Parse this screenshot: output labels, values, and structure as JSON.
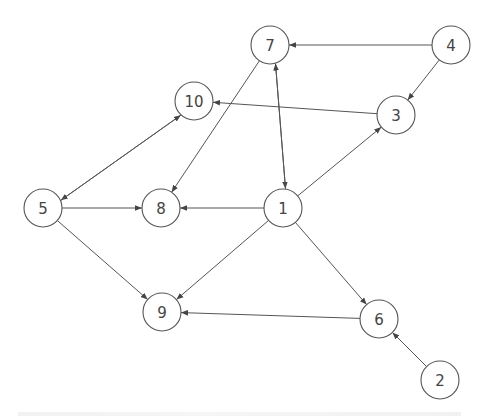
{
  "diagram": {
    "type": "directed-graph",
    "node_radius": 19,
    "stroke_color": "#555555",
    "nodes": [
      {
        "id": "1",
        "label": "1",
        "x": 283,
        "y": 208
      },
      {
        "id": "2",
        "label": "2",
        "x": 440,
        "y": 380
      },
      {
        "id": "3",
        "label": "3",
        "x": 396,
        "y": 115
      },
      {
        "id": "4",
        "label": "4",
        "x": 451,
        "y": 45
      },
      {
        "id": "5",
        "label": "5",
        "x": 43,
        "y": 208
      },
      {
        "id": "6",
        "label": "6",
        "x": 379,
        "y": 319
      },
      {
        "id": "7",
        "label": "7",
        "x": 270,
        "y": 45
      },
      {
        "id": "8",
        "label": "8",
        "x": 161,
        "y": 208
      },
      {
        "id": "9",
        "label": "9",
        "x": 162,
        "y": 312
      },
      {
        "id": "10",
        "label": "10",
        "x": 194,
        "y": 101
      }
    ],
    "edges": [
      {
        "from": "4",
        "to": "7"
      },
      {
        "from": "4",
        "to": "3"
      },
      {
        "from": "3",
        "to": "10"
      },
      {
        "from": "10",
        "to": "5",
        "offset": -4
      },
      {
        "from": "5",
        "to": "10",
        "offset": -4
      },
      {
        "from": "7",
        "to": "8"
      },
      {
        "from": "7",
        "to": "1",
        "offset": 4
      },
      {
        "from": "1",
        "to": "7",
        "offset": 4
      },
      {
        "from": "1",
        "to": "3"
      },
      {
        "from": "1",
        "to": "8"
      },
      {
        "from": "5",
        "to": "8"
      },
      {
        "from": "5",
        "to": "9"
      },
      {
        "from": "1",
        "to": "9"
      },
      {
        "from": "1",
        "to": "6"
      },
      {
        "from": "6",
        "to": "9"
      },
      {
        "from": "2",
        "to": "6"
      }
    ]
  }
}
